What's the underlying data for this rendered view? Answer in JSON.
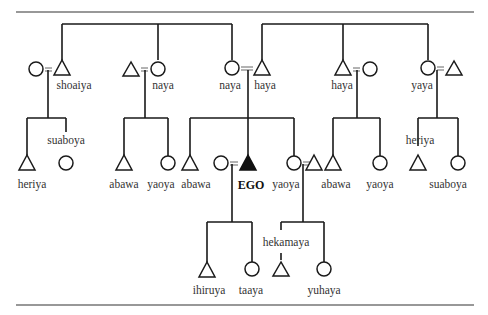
{
  "diagram": {
    "type": "kinship-chart",
    "ego_label": "EGO",
    "generation_1": [
      {
        "pos": "shoaiya-couple-wife",
        "sex": "female",
        "label": ""
      },
      {
        "pos": "shoaiya",
        "sex": "male",
        "label": "shoaiya"
      },
      {
        "pos": "naya-1-husband",
        "sex": "male",
        "label": ""
      },
      {
        "pos": "naya-1",
        "sex": "female",
        "label": "naya"
      },
      {
        "pos": "naya-2",
        "sex": "female",
        "label": "naya"
      },
      {
        "pos": "haya-1",
        "sex": "male",
        "label": "haya"
      },
      {
        "pos": "haya-2",
        "sex": "male",
        "label": "haya"
      },
      {
        "pos": "haya-2-wife",
        "sex": "female",
        "label": ""
      },
      {
        "pos": "yaya",
        "sex": "female",
        "label": "yaya"
      },
      {
        "pos": "yaya-husband",
        "sex": "male",
        "label": ""
      }
    ],
    "generation_2": [
      {
        "sex": "male",
        "label": "heriya"
      },
      {
        "sex": "female",
        "label": "suaboya"
      },
      {
        "sex": "male",
        "label": "abawa"
      },
      {
        "sex": "female",
        "label": "yaoya"
      },
      {
        "sex": "male",
        "label": "abawa"
      },
      {
        "sex": "female",
        "label": ""
      },
      {
        "sex": "male",
        "label": "EGO",
        "ego": true
      },
      {
        "sex": "female",
        "label": "yaoya"
      },
      {
        "sex": "male",
        "label": ""
      },
      {
        "sex": "male",
        "label": "abawa"
      },
      {
        "sex": "female",
        "label": "yaoya"
      },
      {
        "sex": "male",
        "label": "heriya"
      },
      {
        "sex": "female",
        "label": "suaboya"
      }
    ],
    "generation_3": [
      {
        "sex": "male",
        "label": "ihiruya"
      },
      {
        "sex": "female",
        "label": "taaya"
      },
      {
        "sex": "male",
        "label": "hekamaya"
      },
      {
        "sex": "female",
        "label": "yuhaya"
      }
    ]
  },
  "labels": {
    "g1_shoaiya": "shoaiya",
    "g1_naya_a": "naya",
    "g1_naya_b": "naya",
    "g1_haya_a": "haya",
    "g1_haya_b": "haya",
    "g1_yaya": "yaya",
    "g2_suaboya_a": "suaboya",
    "g2_heriya_a": "heriya",
    "g2_abawa_a": "abawa",
    "g2_yaoya_a": "yaoya",
    "g2_abawa_b": "abawa",
    "g2_ego": "EGO",
    "g2_yaoya_b": "yaoya",
    "g2_abawa_c": "abawa",
    "g2_yaoya_c": "yaoya",
    "g2_heriya_b": "heriya",
    "g2_suaboya_b": "suaboya",
    "g3_ihiruya": "ihiruya",
    "g3_taaya": "taaya",
    "g3_hekamaya": "hekamaya",
    "g3_yuhaya": "yuhaya"
  }
}
